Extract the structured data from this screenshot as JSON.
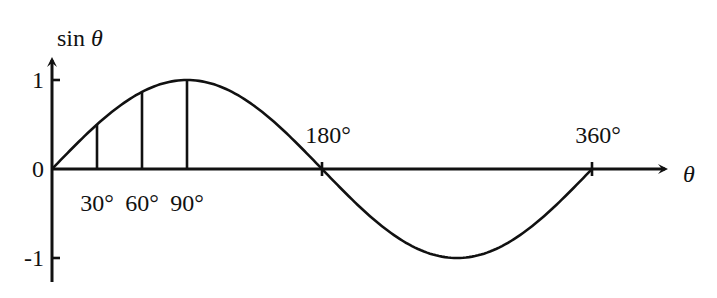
{
  "chart_data": {
    "type": "line",
    "title": "",
    "xlabel": "θ",
    "ylabel": "sin θ",
    "xlim": [
      0,
      360
    ],
    "ylim": [
      -1,
      1
    ],
    "grid": false,
    "legend": "none",
    "x": [
      0,
      15,
      30,
      45,
      60,
      75,
      90,
      105,
      120,
      135,
      150,
      165,
      180,
      195,
      210,
      225,
      240,
      255,
      270,
      285,
      300,
      315,
      330,
      345,
      360
    ],
    "series": [
      {
        "name": "sin θ",
        "values": [
          0,
          0.259,
          0.5,
          0.707,
          0.866,
          0.966,
          1,
          0.966,
          0.866,
          0.707,
          0.5,
          0.259,
          0,
          -0.259,
          -0.5,
          -0.707,
          -0.866,
          -0.966,
          -1,
          -0.966,
          -0.866,
          -0.707,
          -0.5,
          -0.259,
          0
        ]
      }
    ],
    "vertical_markers": [
      {
        "x": 30,
        "value": 0.5,
        "label": "30°"
      },
      {
        "x": 60,
        "value": 0.866,
        "label": "60°"
      },
      {
        "x": 90,
        "value": 1,
        "label": "90°"
      }
    ],
    "x_ticks": [
      {
        "x": 180,
        "label": "180°"
      },
      {
        "x": 360,
        "label": "360°"
      }
    ],
    "y_ticks": [
      {
        "y": 1,
        "label": "1"
      },
      {
        "y": 0,
        "label": "0"
      },
      {
        "y": -1,
        "label": "-1"
      }
    ]
  }
}
